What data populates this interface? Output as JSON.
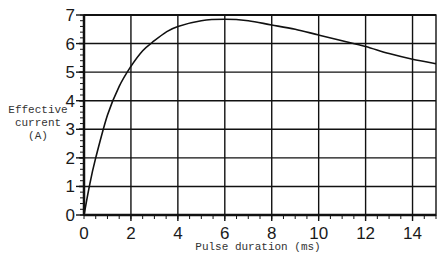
{
  "chart_data": {
    "type": "line",
    "title": "",
    "xlabel": "Pulse duration (ms)",
    "ylabel": "Effective current (A)",
    "ylabel_lines": [
      "Effective",
      "current",
      "(A)"
    ],
    "xlim": [
      0,
      15
    ],
    "ylim": [
      0,
      7
    ],
    "xticks": [
      0,
      2,
      4,
      6,
      8,
      10,
      12,
      14
    ],
    "yticks": [
      0,
      1,
      2,
      3,
      4,
      5,
      6,
      7
    ],
    "grid": true,
    "legend": null,
    "series": [
      {
        "name": "Effective current",
        "x": [
          0,
          0.25,
          0.5,
          1,
          1.5,
          2,
          2.5,
          3,
          3.5,
          4,
          5,
          6,
          7,
          8,
          9,
          10,
          11,
          12,
          13,
          14,
          15
        ],
        "y": [
          0,
          1.1,
          2.0,
          3.5,
          4.5,
          5.2,
          5.75,
          6.1,
          6.4,
          6.6,
          6.8,
          6.85,
          6.8,
          6.65,
          6.5,
          6.3,
          6.1,
          5.9,
          5.65,
          5.45,
          5.3
        ]
      }
    ]
  },
  "colors": {
    "line": "#111111",
    "grid": "#111111",
    "background": "#ffffff"
  }
}
